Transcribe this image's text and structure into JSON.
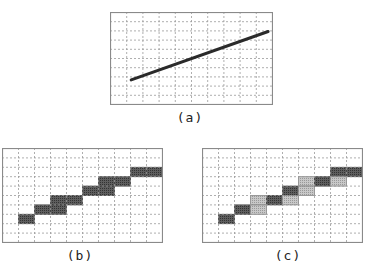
{
  "figure": {
    "captions": {
      "a": "(a)",
      "b": "(b)",
      "c": "(c)"
    },
    "colors": {
      "border": "#8a8a8a",
      "grid": "#9a9a9a",
      "line": "#2a2a2a",
      "dark_cell": "#5e5e5e",
      "light_cell": "#c8c8c8"
    },
    "grid": {
      "cols": 10,
      "rows": 10
    },
    "panel_a": {
      "description": "Ideal straight line over pixel grid",
      "line": {
        "x1": 0.13,
        "y1": 0.73,
        "x2": 0.97,
        "y2": 0.21
      }
    },
    "panel_b": {
      "description": "Aliased rasterization (single intensity)",
      "cells": [
        {
          "col": 1,
          "row": 7,
          "shade": "dark"
        },
        {
          "col": 2,
          "row": 6,
          "shade": "dark"
        },
        {
          "col": 3,
          "row": 6,
          "shade": "dark"
        },
        {
          "col": 3,
          "row": 5,
          "shade": "dark"
        },
        {
          "col": 4,
          "row": 5,
          "shade": "dark"
        },
        {
          "col": 5,
          "row": 4,
          "shade": "dark"
        },
        {
          "col": 6,
          "row": 4,
          "shade": "dark"
        },
        {
          "col": 6,
          "row": 3,
          "shade": "dark"
        },
        {
          "col": 7,
          "row": 3,
          "shade": "dark"
        },
        {
          "col": 8,
          "row": 2,
          "shade": "dark"
        },
        {
          "col": 9,
          "row": 2,
          "shade": "dark"
        }
      ]
    },
    "panel_c": {
      "description": "Anti-aliased rasterization (two intensities)",
      "cells": [
        {
          "col": 1,
          "row": 7,
          "shade": "dark"
        },
        {
          "col": 2,
          "row": 6,
          "shade": "dark"
        },
        {
          "col": 3,
          "row": 5,
          "shade": "light"
        },
        {
          "col": 3,
          "row": 6,
          "shade": "light"
        },
        {
          "col": 4,
          "row": 5,
          "shade": "dark"
        },
        {
          "col": 5,
          "row": 4,
          "shade": "dark"
        },
        {
          "col": 5,
          "row": 5,
          "shade": "light"
        },
        {
          "col": 6,
          "row": 3,
          "shade": "light"
        },
        {
          "col": 6,
          "row": 4,
          "shade": "light"
        },
        {
          "col": 7,
          "row": 3,
          "shade": "dark"
        },
        {
          "col": 8,
          "row": 2,
          "shade": "dark"
        },
        {
          "col": 8,
          "row": 3,
          "shade": "light"
        },
        {
          "col": 9,
          "row": 2,
          "shade": "dark"
        }
      ]
    }
  }
}
